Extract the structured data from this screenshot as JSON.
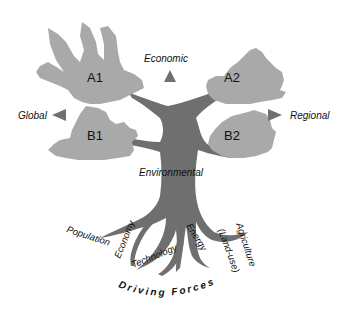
{
  "diagram": {
    "type": "tree-metaphor",
    "colors": {
      "canopy": "#a9a9a9",
      "trunk": "#6f6f6f",
      "arrows": "#707070",
      "text": "#111111",
      "background": "#ffffff"
    },
    "scenarios": {
      "a1": "A1",
      "a2": "A2",
      "b1": "B1",
      "b2": "B2"
    },
    "axes": {
      "top": "Economic",
      "left": "Global",
      "right": "Regional",
      "bottom": "Environmental"
    },
    "roots": [
      {
        "label": "Population"
      },
      {
        "label": "Economy"
      },
      {
        "label": "Technology"
      },
      {
        "label": "Energy"
      },
      {
        "label": "Agriculture"
      },
      {
        "label": "(Land-use)"
      }
    ],
    "footer": "Driving Forces"
  }
}
